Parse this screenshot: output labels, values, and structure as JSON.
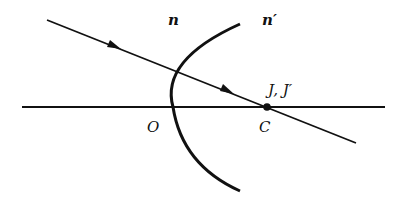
{
  "diagram": {
    "type": "optics-refraction-spherical-surface",
    "labels": {
      "n": "n",
      "n_prime": "n′",
      "vertex": "O",
      "center": "C",
      "points": "J, J′"
    },
    "colors": {
      "stroke": "#111111",
      "background": "#ffffff"
    },
    "optical_axis": {
      "x1": 22,
      "y1": 107,
      "x2": 385,
      "y2": 107
    },
    "ray": {
      "x1": 47,
      "y1": 20,
      "x2": 356,
      "y2": 143
    },
    "surface_arc": {
      "top": [
        240,
        24
      ],
      "vertex": [
        173,
        107
      ],
      "bottom": [
        240,
        191
      ]
    },
    "center_point": {
      "x": 267,
      "y": 107
    },
    "arrows": [
      {
        "x": 116,
        "y": 47
      },
      {
        "x": 228,
        "y": 91
      }
    ]
  }
}
